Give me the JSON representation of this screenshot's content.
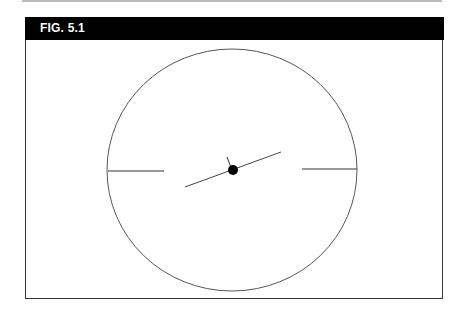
{
  "figure": {
    "label": "FIG. 5.1"
  },
  "diagram": {
    "circle": {
      "cx": 232,
      "cy": 170,
      "rx": 125,
      "ry": 121,
      "stroke": "#555555"
    },
    "left_tick": {
      "x1": 108,
      "y1": 171,
      "x2": 164,
      "y2": 171
    },
    "right_tick": {
      "x1": 302,
      "y1": 169,
      "x2": 357,
      "y2": 169
    },
    "needle": {
      "x1": 185,
      "y1": 187,
      "x2": 281,
      "y2": 152
    },
    "pointer": {
      "x1": 227,
      "y1": 157,
      "x2": 232,
      "y2": 170
    },
    "hub": {
      "cx": 233,
      "cy": 170,
      "r": 5,
      "fill": "#000000"
    }
  }
}
